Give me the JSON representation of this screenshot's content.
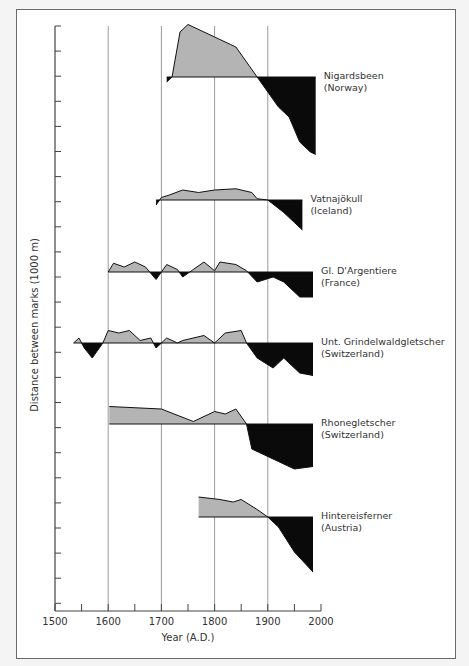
{
  "chart_data": {
    "type": "area",
    "title": "",
    "xlabel": "Year (A.D.)",
    "ylabel": "Distance between marks (1000 m)",
    "xlim": [
      1500,
      2000
    ],
    "x_ticks": [
      1500,
      1600,
      1700,
      1800,
      1900,
      2000
    ],
    "x_minor_ticks": [
      1550,
      1650,
      1750,
      1850,
      1950
    ],
    "gridlines_x": [
      1600,
      1700,
      1800,
      1900
    ],
    "y_tick_spacing_units": "1000 m per tick mark",
    "legend": "none; each series labeled at right",
    "fill_colors": {
      "advance": "#b4b4b4",
      "retreat": "#0a0a0a"
    },
    "series": [
      {
        "name": "Nigardsbeen",
        "region": "(Norway)",
        "start_year": 1710,
        "end_year": 1990,
        "points": [
          [
            1710,
            -0.2
          ],
          [
            1720,
            0
          ],
          [
            1735,
            1.8
          ],
          [
            1750,
            2.1
          ],
          [
            1800,
            1.6
          ],
          [
            1830,
            1.3
          ],
          [
            1840,
            1.2
          ],
          [
            1880,
            0
          ],
          [
            1900,
            -0.6
          ],
          [
            1920,
            -1.2
          ],
          [
            1940,
            -1.6
          ],
          [
            1960,
            -2.6
          ],
          [
            1980,
            -3.0
          ],
          [
            1990,
            -3.1
          ]
        ]
      },
      {
        "name": "Vatnajökull",
        "region": "(Iceland)",
        "start_year": 1690,
        "end_year": 1965,
        "points": [
          [
            1690,
            -0.2
          ],
          [
            1700,
            0.1
          ],
          [
            1715,
            0.2
          ],
          [
            1740,
            0.4
          ],
          [
            1770,
            0.3
          ],
          [
            1800,
            0.4
          ],
          [
            1840,
            0.45
          ],
          [
            1870,
            0.3
          ],
          [
            1880,
            0.05
          ],
          [
            1900,
            0
          ],
          [
            1930,
            -0.5
          ],
          [
            1950,
            -0.9
          ],
          [
            1965,
            -1.2
          ]
        ]
      },
      {
        "name": "Gl. D'Argentiere",
        "region": "(France)",
        "start_year": 1600,
        "end_year": 1985,
        "points": [
          [
            1600,
            0
          ],
          [
            1610,
            0.35
          ],
          [
            1630,
            0.2
          ],
          [
            1650,
            0.4
          ],
          [
            1670,
            0.2
          ],
          [
            1690,
            -0.3
          ],
          [
            1700,
            0
          ],
          [
            1710,
            0.3
          ],
          [
            1730,
            0.1
          ],
          [
            1740,
            -0.2
          ],
          [
            1760,
            0.1
          ],
          [
            1780,
            0.4
          ],
          [
            1800,
            0.05
          ],
          [
            1810,
            0.4
          ],
          [
            1840,
            0.3
          ],
          [
            1860,
            0.05
          ],
          [
            1880,
            -0.4
          ],
          [
            1910,
            -0.2
          ],
          [
            1930,
            -0.4
          ],
          [
            1960,
            -1.0
          ],
          [
            1985,
            -1.0
          ]
        ]
      },
      {
        "name": "Unt. Grindelwaldgletscher",
        "region": "(Switzerland)",
        "start_year": 1535,
        "end_year": 1985,
        "points": [
          [
            1535,
            0
          ],
          [
            1545,
            0.2
          ],
          [
            1555,
            -0.2
          ],
          [
            1570,
            -0.6
          ],
          [
            1590,
            0
          ],
          [
            1600,
            0.5
          ],
          [
            1620,
            0.4
          ],
          [
            1640,
            0.5
          ],
          [
            1660,
            0.1
          ],
          [
            1680,
            0.2
          ],
          [
            1690,
            -0.2
          ],
          [
            1710,
            0.2
          ],
          [
            1730,
            0
          ],
          [
            1740,
            0.1
          ],
          [
            1780,
            0.3
          ],
          [
            1800,
            0
          ],
          [
            1820,
            0.4
          ],
          [
            1850,
            0.5
          ],
          [
            1860,
            0
          ],
          [
            1880,
            -0.6
          ],
          [
            1910,
            -1.0
          ],
          [
            1930,
            -0.6
          ],
          [
            1960,
            -1.2
          ],
          [
            1985,
            -1.3
          ]
        ]
      },
      {
        "name": "Rhonegletscher",
        "region": "(Switzerland)",
        "start_year": 1602,
        "end_year": 1985,
        "points": [
          [
            1602,
            0.7
          ],
          [
            1700,
            0.6
          ],
          [
            1760,
            0.1
          ],
          [
            1800,
            0.5
          ],
          [
            1820,
            0.4
          ],
          [
            1840,
            0.6
          ],
          [
            1860,
            0
          ],
          [
            1870,
            -1.0
          ],
          [
            1920,
            -1.5
          ],
          [
            1950,
            -1.8
          ],
          [
            1985,
            -1.7
          ]
        ]
      },
      {
        "name": "Hintereisferner",
        "region": "(Austria)",
        "start_year": 1770,
        "end_year": 1985,
        "points": [
          [
            1770,
            0.8
          ],
          [
            1810,
            0.7
          ],
          [
            1835,
            0.6
          ],
          [
            1850,
            0.7
          ],
          [
            1880,
            0.3
          ],
          [
            1900,
            0
          ],
          [
            1920,
            -0.4
          ],
          [
            1950,
            -1.4
          ],
          [
            1985,
            -2.2
          ]
        ]
      }
    ]
  }
}
